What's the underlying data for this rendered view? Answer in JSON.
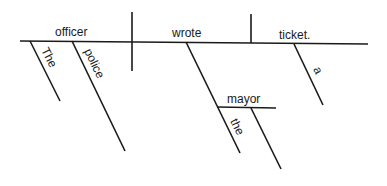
{
  "diagram": {
    "type": "sentence-diagram",
    "sentence": "The police officer wrote the mayor a ticket.",
    "subject": "officer",
    "verb": "wrote",
    "direct_object": "ticket.",
    "indirect_object": "mayor",
    "modifiers": {
      "officer": [
        "The",
        "police"
      ],
      "mayor": [
        "the"
      ],
      "ticket": [
        "a"
      ]
    },
    "line_color": "#1a1a1a"
  }
}
